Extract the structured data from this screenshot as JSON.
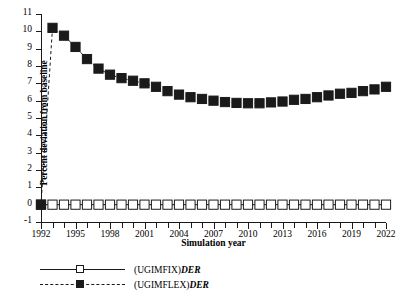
{
  "chart_data": {
    "type": "line",
    "title": "",
    "xlabel": "Simulation year",
    "ylabel": "Percent deviation from baseline",
    "xlim": [
      1992,
      2022
    ],
    "ylim": [
      -1,
      11
    ],
    "ytick_step": 1,
    "xtick_step": 3,
    "grid": false,
    "legend_position": "below-left",
    "x": [
      1992,
      1993,
      1994,
      1995,
      1996,
      1997,
      1998,
      1999,
      2000,
      2001,
      2002,
      2003,
      2004,
      2005,
      2006,
      2007,
      2008,
      2009,
      2010,
      2011,
      2012,
      2013,
      2014,
      2015,
      2016,
      2017,
      2018,
      2019,
      2020,
      2021,
      2022
    ],
    "xtick_labels": [
      "1992",
      "1995",
      "1998",
      "2001",
      "2004",
      "2007",
      "2010",
      "2013",
      "2016",
      "2019",
      "2022"
    ],
    "ytick_labels": [
      "-1",
      "0",
      "1",
      "2",
      "3",
      "4",
      "5",
      "6",
      "7",
      "8",
      "9",
      "10",
      "11"
    ],
    "series": [
      {
        "name": "(UGIMFIX)DER",
        "label_main": "(UGIMFIX)",
        "label_italic": "DER",
        "marker": "open-square",
        "line": "solid",
        "color": "#1a1a1a",
        "values": [
          0,
          0,
          0,
          0,
          0,
          0,
          0,
          0,
          0,
          0,
          0,
          0,
          0,
          0,
          0,
          0,
          0,
          0,
          0,
          0,
          0,
          0,
          0,
          0,
          0,
          0,
          0,
          0,
          0,
          0,
          0
        ]
      },
      {
        "name": "(UGIMFLEX)DER",
        "label_main": "(UGIMFLEX)",
        "label_italic": "DER",
        "marker": "filled-square",
        "line": "dashed",
        "color": "#1a1a1a",
        "values": [
          0,
          10.2,
          9.75,
          9.1,
          8.4,
          7.85,
          7.5,
          7.3,
          7.15,
          7.0,
          6.8,
          6.55,
          6.35,
          6.2,
          6.1,
          6.0,
          5.92,
          5.87,
          5.85,
          5.85,
          5.9,
          5.95,
          6.05,
          6.1,
          6.2,
          6.3,
          6.4,
          6.45,
          6.55,
          6.65,
          6.8
        ]
      }
    ]
  }
}
